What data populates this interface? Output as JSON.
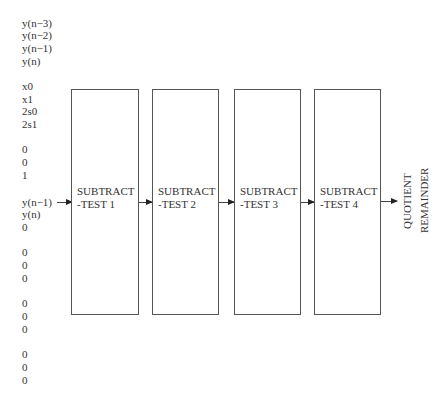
{
  "diagram": {
    "title": "",
    "input_groups": [
      {
        "lines": [
          "y(n−3)",
          "y(n−2)",
          "y(n−1)",
          "y(n)"
        ]
      },
      {
        "lines": [
          "x0",
          "x1",
          "2s0",
          "2s1"
        ]
      },
      {
        "lines": [
          "0",
          "0",
          "1"
        ]
      },
      {
        "lines": [
          "y(n−1)",
          "y(n)",
          "0"
        ]
      },
      {
        "lines": [
          "0",
          "0",
          "0"
        ]
      },
      {
        "lines": [
          "0",
          "0",
          "0"
        ]
      },
      {
        "lines": [
          "0",
          "0",
          "0"
        ]
      }
    ],
    "stages": [
      {
        "line1": "SUBTRACT",
        "line2": "-TEST 1"
      },
      {
        "line1": "SUBTRACT",
        "line2": "-TEST 2"
      },
      {
        "line1": "SUBTRACT",
        "line2": "-TEST 3"
      },
      {
        "line1": "SUBTRACT",
        "line2": "-TEST 4"
      }
    ],
    "outputs": [
      "QUOTIENT",
      "REMAINDER"
    ],
    "colors": {
      "text": "#333333",
      "box_border": "#555555",
      "arrow": "#444444",
      "background": "#ffffff"
    }
  }
}
